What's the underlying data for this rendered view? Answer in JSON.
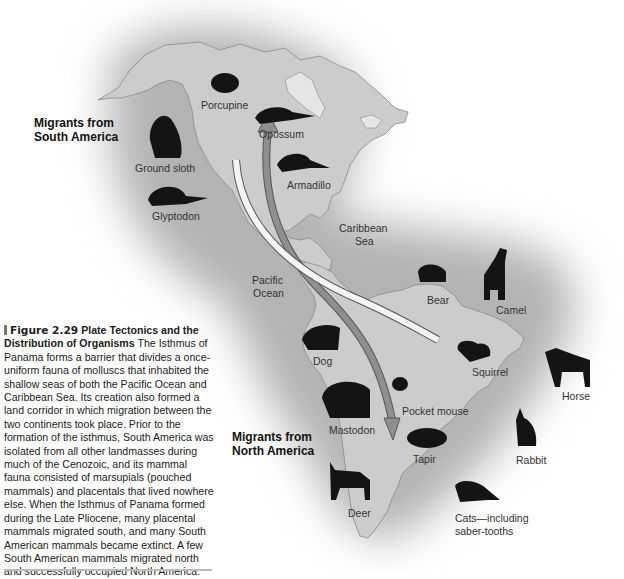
{
  "figure": {
    "number": "Figure 2.29",
    "title": "Plate Tectonics and the Distribution of Organisms",
    "caption": "The Isthmus of Panama forms a barrier that divides a once-uniform fauna of molluscs that inhabited the shallow seas of both the Pacific Ocean and Caribbean Sea. Its creation also formed a land corridor in which migration between the two continents took place. Prior to the formation of the isthmus, South America was isolated from all other landmasses during much of the Cenozoic, and its mammal fauna consisted of marsupials (pouched mammals) and placentals that lived nowhere else. When the Isthmus of Panama formed during the Late Pliocene, many placental mammals migrated south, and many South American mammals became extinct. A few South American mammals migrated north and successfully occupied North America."
  },
  "groups": {
    "from_south": {
      "line1": "Migrants from",
      "line2": "South America"
    },
    "from_north": {
      "line1": "Migrants from",
      "line2": "North America"
    }
  },
  "water_labels": {
    "caribbean_1": "Caribbean",
    "caribbean_2": "Sea",
    "pacific_1": "Pacific",
    "pacific_2": "Ocean"
  },
  "animals_south_to_north": [
    {
      "name": "Porcupine"
    },
    {
      "name": "Opossum"
    },
    {
      "name": "Ground sloth"
    },
    {
      "name": "Armadillo"
    },
    {
      "name": "Glyptodon"
    }
  ],
  "animals_north_to_south": [
    {
      "name": "Bear"
    },
    {
      "name": "Camel"
    },
    {
      "name": "Dog"
    },
    {
      "name": "Squirrel"
    },
    {
      "name": "Horse"
    },
    {
      "name": "Pocket mouse"
    },
    {
      "name": "Mastodon"
    },
    {
      "name": "Tapir"
    },
    {
      "name": "Rabbit"
    },
    {
      "name": "Deer"
    },
    {
      "name": "Cats—including"
    },
    {
      "name": "saber-tooths"
    }
  ],
  "colors": {
    "land": "#c9c9c9",
    "glow": "#a8a8a8",
    "coast": "#8a8a8a",
    "silhouette": "#141414",
    "arrow_north": "#8c8c8c",
    "arrow_south": "#f4f4f4"
  }
}
